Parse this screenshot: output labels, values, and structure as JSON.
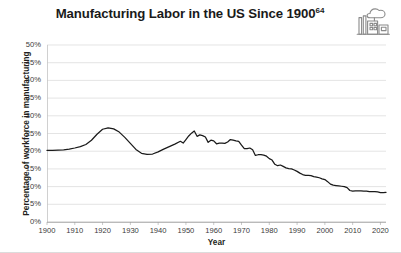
{
  "figure": {
    "title": "Manufacturing Labor in the US Since 1900",
    "title_superscript": "64",
    "icon": "factory-icon",
    "background_color": "#ffffff",
    "line_color": "#1a1a1a",
    "grid_color": "#d9d9d9"
  },
  "chart_data": {
    "type": "line",
    "title": "Manufacturing Labor in the US Since 1900",
    "xlabel": "Year",
    "ylabel": "Percentage of workforce in manufacturing",
    "xlim": [
      1900,
      2022
    ],
    "ylim": [
      0,
      50
    ],
    "grid": true,
    "legend": null,
    "xticks": [
      1900,
      1910,
      1920,
      1930,
      1940,
      1950,
      1960,
      1970,
      1980,
      1990,
      2000,
      2010,
      2020
    ],
    "xtick_labels": [
      "1900",
      "1910",
      "1920",
      "1930",
      "1940",
      "1950",
      "1960",
      "1970",
      "1980",
      "1990",
      "2000",
      "2010",
      "2020"
    ],
    "yticks": [
      0,
      5,
      10,
      15,
      20,
      25,
      30,
      35,
      40,
      45,
      50
    ],
    "ytick_labels": [
      "0%",
      "5%",
      "10%",
      "15%",
      "20%",
      "25%",
      "30%",
      "35%",
      "40%",
      "45%",
      "50%"
    ],
    "series": [
      {
        "name": "Percentage of workforce in manufacturing",
        "x": [
          1900,
          1902,
          1904,
          1906,
          1908,
          1910,
          1912,
          1914,
          1916,
          1918,
          1920,
          1922,
          1924,
          1926,
          1928,
          1930,
          1932,
          1934,
          1936,
          1938,
          1940,
          1942,
          1944,
          1946,
          1948,
          1949,
          1950,
          1951,
          1952,
          1953,
          1954,
          1955,
          1956,
          1957,
          1958,
          1959,
          1960,
          1961,
          1962,
          1963,
          1964,
          1965,
          1966,
          1967,
          1968,
          1969,
          1970,
          1971,
          1972,
          1973,
          1974,
          1975,
          1976,
          1977,
          1978,
          1979,
          1980,
          1981,
          1982,
          1983,
          1984,
          1985,
          1986,
          1987,
          1988,
          1989,
          1990,
          1991,
          1992,
          1993,
          1994,
          1995,
          1996,
          1997,
          1998,
          1999,
          2000,
          2001,
          2002,
          2003,
          2004,
          2005,
          2006,
          2007,
          2008,
          2009,
          2010,
          2011,
          2012,
          2013,
          2014,
          2015,
          2016,
          2017,
          2018,
          2019,
          2020,
          2021,
          2022
        ],
        "y": [
          20.2,
          20.2,
          20.3,
          20.4,
          20.6,
          20.9,
          21.3,
          21.9,
          23.1,
          24.8,
          26.2,
          26.6,
          26.3,
          25.4,
          23.9,
          22.2,
          20.5,
          19.4,
          19.1,
          19.2,
          19.8,
          20.6,
          21.3,
          22.0,
          22.8,
          22.3,
          23.3,
          24.3,
          25.1,
          25.7,
          24.2,
          24.6,
          24.4,
          24.0,
          22.5,
          23.1,
          22.9,
          22.1,
          22.3,
          22.3,
          22.2,
          22.6,
          23.3,
          23.1,
          22.9,
          22.8,
          21.7,
          20.7,
          20.7,
          20.9,
          20.4,
          18.8,
          19.0,
          19.0,
          18.9,
          18.6,
          17.9,
          17.5,
          16.3,
          15.9,
          16.1,
          15.7,
          15.3,
          15.1,
          15.0,
          14.7,
          14.3,
          13.8,
          13.4,
          13.2,
          13.2,
          13.1,
          12.8,
          12.7,
          12.5,
          12.2,
          12.0,
          11.4,
          10.7,
          10.4,
          10.3,
          10.2,
          10.1,
          10.0,
          9.7,
          8.9,
          8.7,
          8.8,
          8.8,
          8.8,
          8.7,
          8.7,
          8.6,
          8.6,
          8.6,
          8.5,
          8.3,
          8.3,
          8.4
        ]
      }
    ]
  },
  "axes": {
    "y_title": "Percentage of workforce in manufacturing",
    "x_title": "Year"
  }
}
